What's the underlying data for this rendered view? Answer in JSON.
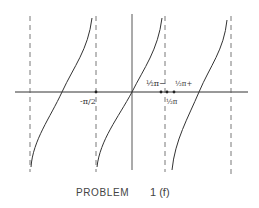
{
  "diagram": {
    "stroke_color": "#333333",
    "labels": {
      "neg_half_pi": "-π/2",
      "half_pi_minus": "½π−",
      "half_pi_plus": "½π+",
      "half_pi": "½π"
    },
    "caption": {
      "problem_word": "PROBLEM",
      "problem_id": "1 (f)"
    }
  }
}
